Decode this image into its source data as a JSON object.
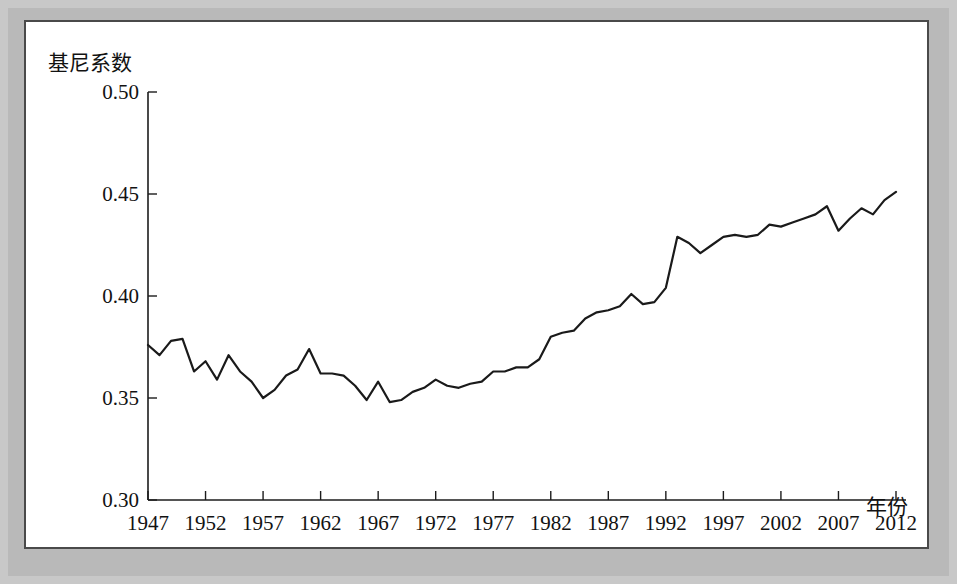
{
  "chart_data": {
    "type": "line",
    "title": "",
    "subtitle": "",
    "xlabel": "年份",
    "ylabel": "基尼系数",
    "xlim": [
      1947,
      2012
    ],
    "ylim": [
      0.3,
      0.5
    ],
    "grid": false,
    "legend": null,
    "y_ticks": [
      "0.30",
      "0.35",
      "0.40",
      "0.45",
      "0.50"
    ],
    "y_tick_values": [
      0.3,
      0.35,
      0.4,
      0.45,
      0.5
    ],
    "x_ticks": [
      "1947",
      "1952",
      "1957",
      "1962",
      "1967",
      "1972",
      "1977",
      "1982",
      "1987",
      "1992",
      "1997",
      "2002",
      "2007",
      "2012"
    ],
    "x_tick_values": [
      1947,
      1952,
      1957,
      1962,
      1967,
      1972,
      1977,
      1982,
      1987,
      1992,
      1997,
      2002,
      2007,
      2012
    ],
    "line_color": "#1a1a1a",
    "series": [
      {
        "name": "基尼系数",
        "x": [
          1947,
          1948,
          1949,
          1950,
          1951,
          1952,
          1953,
          1954,
          1955,
          1956,
          1957,
          1958,
          1959,
          1960,
          1961,
          1962,
          1963,
          1964,
          1965,
          1966,
          1967,
          1968,
          1969,
          1970,
          1971,
          1972,
          1973,
          1974,
          1975,
          1976,
          1977,
          1978,
          1979,
          1980,
          1981,
          1982,
          1983,
          1984,
          1985,
          1986,
          1987,
          1988,
          1989,
          1990,
          1991,
          1992,
          1993,
          1994,
          1995,
          1996,
          1997,
          1998,
          1999,
          2000,
          2001,
          2002,
          2003,
          2004,
          2005,
          2006,
          2007,
          2008,
          2009,
          2010,
          2011,
          2012
        ],
        "values": [
          0.376,
          0.371,
          0.378,
          0.379,
          0.363,
          0.368,
          0.359,
          0.371,
          0.363,
          0.358,
          0.35,
          0.354,
          0.361,
          0.364,
          0.374,
          0.362,
          0.362,
          0.361,
          0.356,
          0.349,
          0.358,
          0.348,
          0.349,
          0.353,
          0.355,
          0.359,
          0.356,
          0.355,
          0.357,
          0.358,
          0.363,
          0.363,
          0.365,
          0.365,
          0.369,
          0.38,
          0.382,
          0.383,
          0.389,
          0.392,
          0.393,
          0.395,
          0.401,
          0.396,
          0.397,
          0.404,
          0.429,
          0.426,
          0.421,
          0.425,
          0.429,
          0.43,
          0.429,
          0.43,
          0.435,
          0.434,
          0.436,
          0.438,
          0.44,
          0.444,
          0.432,
          0.438,
          0.443,
          0.44,
          0.447,
          0.451
        ]
      }
    ]
  },
  "axis": {
    "y_label_text": "基尼系数",
    "x_label_text": "年份"
  }
}
